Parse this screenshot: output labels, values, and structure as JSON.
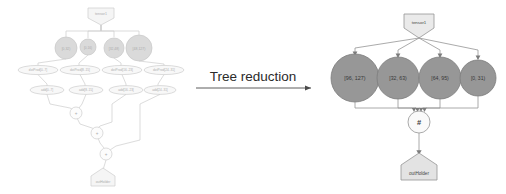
{
  "figure": {
    "caption": "Tree reduction",
    "arrow": "right-arrow"
  },
  "colors": {
    "circle_fill_right": "#8c8c8c",
    "circle_fill_left": "#a9a9a9",
    "pentagon_fill": "#e8e8e8",
    "ellipse_fill": "#f0f0f0",
    "op_fill": "#fafafa",
    "stroke": "#8a8a8a",
    "text": "#333333",
    "arrow_color": "#4a4a4a",
    "caption_color": "#2b2b2b"
  },
  "left_graph": {
    "name": "unreduced-dataflow-graph",
    "source_node": {
      "label": "tensor1",
      "shape": "pentagon"
    },
    "sink_node": {
      "label": "outHolder",
      "shape": "pentagon"
    },
    "partitions": [
      {
        "label": "[0,32)",
        "r": 11
      },
      {
        "label": "[0,16)",
        "r": 8
      },
      {
        "label": "[32,48)",
        "r": 10
      },
      {
        "label": "[48,127)",
        "r": 13
      }
    ],
    "row1_ops": [
      {
        "label": "dotProd[0..7]"
      },
      {
        "label": "dotProd[8..15]"
      },
      {
        "label": "dotProd[16..23]"
      },
      {
        "label": "dotProd[24..31]"
      }
    ],
    "row2_ops": [
      {
        "label": "add[0..7]"
      },
      {
        "label": "add[8..15]"
      },
      {
        "label": "add[16..23]"
      },
      {
        "label": "add[24..31]"
      }
    ],
    "reduce_chain": [
      {
        "label": "+"
      },
      {
        "label": "+"
      },
      {
        "label": "+"
      }
    ]
  },
  "right_graph": {
    "name": "reduced-dataflow-graph",
    "source_node": {
      "label": "tensor1",
      "shape": "pentagon"
    },
    "sink_node": {
      "label": "outHolder",
      "shape": "pentagon"
    },
    "reducer_node": {
      "label": "#",
      "shape": "circle"
    },
    "partitions": [
      {
        "label": "[96, 127)",
        "r": 24
      },
      {
        "label": "[32, 63)",
        "r": 21
      },
      {
        "label": "[64, 95)",
        "r": 21
      },
      {
        "label": "[0, 31)",
        "r": 18
      }
    ]
  }
}
